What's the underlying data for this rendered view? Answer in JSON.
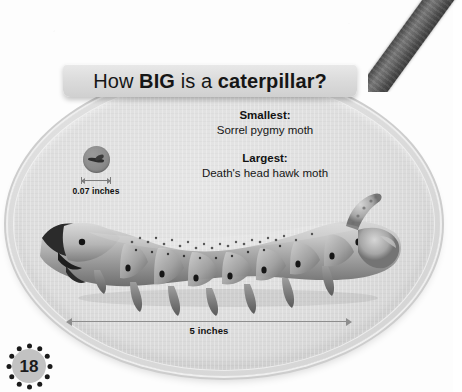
{
  "page": {
    "number": "18",
    "background_color": "#fdfdfd"
  },
  "decorations": {
    "twig": "twig-branch-decoration"
  },
  "card": {
    "shape": "oval",
    "fill_color": "#dedede",
    "border_color": "#cdcdcd"
  },
  "title": {
    "part1": "How ",
    "part2": "BIG",
    "part3": " is a ",
    "part4": "caterpillar?",
    "full": "How BIG is a caterpillar?",
    "background_color": "#dcdcdc"
  },
  "facts": [
    {
      "heading": "Smallest:",
      "value": "Sorrel pygmy moth"
    },
    {
      "heading": "Largest:",
      "value": "Death's head hawk moth"
    }
  ],
  "small_specimen": {
    "icon": "moth-silhouette-icon",
    "measure_label": "0.07 inches",
    "circle_color": "#8b8b8b"
  },
  "large_specimen": {
    "icon": "caterpillar-photo",
    "measure_label": "5 inches",
    "arrow_color": "#8d8d8d"
  },
  "chart_data": {
    "type": "bar",
    "title": "How BIG is a caterpillar?",
    "xlabel": "",
    "ylabel": "Length (inches)",
    "categories": [
      "Sorrel pygmy moth",
      "Death's head hawk moth"
    ],
    "values": [
      0.07,
      5
    ],
    "value_labels": [
      "0.07 inches",
      "5 inches"
    ],
    "series": [
      {
        "name": "Caterpillar length",
        "values": [
          0.07,
          5
        ]
      }
    ],
    "annotations": [
      "Smallest: Sorrel pygmy moth",
      "Largest: Death's head hawk moth"
    ],
    "grid": false,
    "legend": "none",
    "ylim": [
      0,
      5
    ]
  }
}
